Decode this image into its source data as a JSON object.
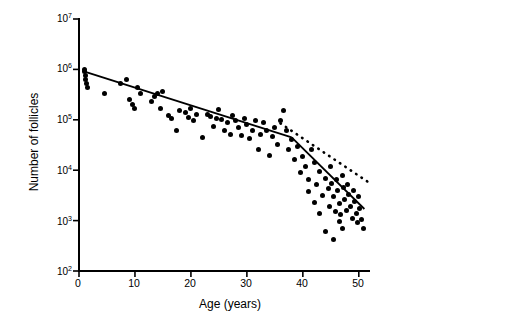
{
  "chart_data": {
    "type": "scatter",
    "title": "",
    "xlabel": "Age (years)",
    "ylabel": "Number of follicles",
    "xlim": [
      0,
      52
    ],
    "ylim_log10": [
      2,
      7
    ],
    "xticks": [
      0,
      10,
      20,
      30,
      40,
      50
    ],
    "xtick_labels": [
      "0",
      "10",
      "20",
      "30",
      "40",
      "50"
    ],
    "ytick_labels": [
      "10^2",
      "10^3",
      "10^4",
      "10^5",
      "10^6",
      "10^7"
    ],
    "ytick_mantissa": [
      "10",
      "10",
      "10",
      "10",
      "10",
      "10"
    ],
    "ytick_exponents": [
      "2",
      "3",
      "4",
      "5",
      "6",
      "7"
    ],
    "grid": false,
    "legend": "none",
    "series": [
      {
        "name": "follicle counts",
        "marker": "filled-circle",
        "color": "#000000",
        "points": [
          [
            1.0,
            1000000
          ],
          [
            1.0,
            900000
          ],
          [
            1.2,
            760000
          ],
          [
            1.2,
            620000
          ],
          [
            1.3,
            520000
          ],
          [
            1.5,
            430000
          ],
          [
            4.5,
            330000
          ],
          [
            7.5,
            520000
          ],
          [
            8.5,
            620000
          ],
          [
            9.0,
            250000
          ],
          [
            9.5,
            200000
          ],
          [
            10.0,
            170000
          ],
          [
            10.5,
            430000
          ],
          [
            11.0,
            330000
          ],
          [
            13.0,
            230000
          ],
          [
            13.5,
            290000
          ],
          [
            14.0,
            330000
          ],
          [
            14.5,
            170000
          ],
          [
            15.0,
            360000
          ],
          [
            16.0,
            120000
          ],
          [
            16.5,
            105000
          ],
          [
            17.5,
            60000
          ],
          [
            18.0,
            150000
          ],
          [
            19.0,
            140000
          ],
          [
            19.5,
            110000
          ],
          [
            20.0,
            170000
          ],
          [
            20.5,
            95000
          ],
          [
            21.0,
            130000
          ],
          [
            22.0,
            45000
          ],
          [
            23.0,
            130000
          ],
          [
            23.5,
            115000
          ],
          [
            24.0,
            75000
          ],
          [
            24.5,
            105000
          ],
          [
            25.0,
            160000
          ],
          [
            25.5,
            100000
          ],
          [
            26.0,
            62000
          ],
          [
            26.5,
            88000
          ],
          [
            27.0,
            52000
          ],
          [
            27.5,
            120000
          ],
          [
            28.0,
            95000
          ],
          [
            28.5,
            70000
          ],
          [
            29.0,
            48000
          ],
          [
            29.5,
            105000
          ],
          [
            30.0,
            80000
          ],
          [
            30.5,
            42000
          ],
          [
            31.0,
            60000
          ],
          [
            31.5,
            95000
          ],
          [
            32.0,
            26000
          ],
          [
            32.5,
            52000
          ],
          [
            33.0,
            88000
          ],
          [
            33.5,
            60000
          ],
          [
            34.0,
            20000
          ],
          [
            34.5,
            46000
          ],
          [
            35.0,
            70000
          ],
          [
            35.5,
            33000
          ],
          [
            36.0,
            95000
          ],
          [
            36.5,
            150000
          ],
          [
            37.0,
            60000
          ],
          [
            37.5,
            26000
          ],
          [
            38.0,
            40000
          ],
          [
            38.5,
            16000
          ],
          [
            39.0,
            30000
          ],
          [
            39.5,
            9000
          ],
          [
            40.0,
            19000
          ],
          [
            40.5,
            12000
          ],
          [
            41.0,
            6500
          ],
          [
            41.5,
            26000
          ],
          [
            42.0,
            14000
          ],
          [
            42.5,
            5200
          ],
          [
            43.0,
            9500
          ],
          [
            43.5,
            3200
          ],
          [
            44.0,
            7000
          ],
          [
            44.5,
            4300
          ],
          [
            44.8,
            1900
          ],
          [
            45.0,
            12000
          ],
          [
            45.2,
            5500
          ],
          [
            45.5,
            3000
          ],
          [
            45.8,
            1500
          ],
          [
            46.0,
            6500
          ],
          [
            46.2,
            4000
          ],
          [
            46.5,
            2200
          ],
          [
            46.8,
            1300
          ],
          [
            47.0,
            8000
          ],
          [
            47.2,
            4600
          ],
          [
            47.5,
            2600
          ],
          [
            47.8,
            1600
          ],
          [
            48.0,
            5200
          ],
          [
            48.2,
            3300
          ],
          [
            48.5,
            1900
          ],
          [
            48.8,
            1100
          ],
          [
            49.0,
            4000
          ],
          [
            49.2,
            2400
          ],
          [
            49.5,
            1400
          ],
          [
            49.8,
            900
          ],
          [
            50.0,
            3000
          ],
          [
            50.2,
            1700
          ],
          [
            50.5,
            1050
          ],
          [
            50.8,
            700
          ],
          [
            44.0,
            600
          ],
          [
            45.5,
            420
          ],
          [
            46.5,
            950
          ],
          [
            47.0,
            700
          ],
          [
            43.0,
            1400
          ],
          [
            42.0,
            2300
          ],
          [
            41.0,
            3700
          ]
        ]
      }
    ],
    "annotations": [
      {
        "name": "regression-line-segment-1",
        "style": "solid",
        "x_range": [
          1,
          38
        ],
        "y_range": [
          900000,
          45000
        ]
      },
      {
        "name": "regression-line-segment-2",
        "style": "solid",
        "x_range": [
          38,
          51
        ],
        "y_range": [
          45000,
          1700
        ]
      },
      {
        "name": "extrapolation-line",
        "style": "dotted",
        "x_range": [
          36,
          52
        ],
        "y_range": [
          85000,
          5500
        ]
      }
    ]
  }
}
